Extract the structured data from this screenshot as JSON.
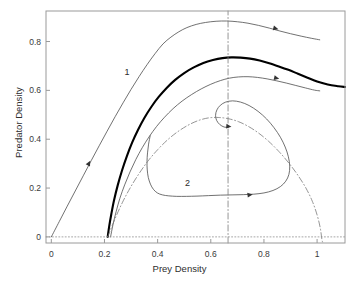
{
  "chart_data": {
    "type": "line",
    "title": "",
    "xlabel": "Prey Density",
    "ylabel": "Predator Density",
    "xlim": [
      -0.02,
      1.105
    ],
    "ylim": [
      -0.025,
      0.925
    ],
    "grid": false,
    "legend": "none",
    "xticks": [
      0,
      0.2,
      0.4,
      0.6,
      0.8,
      1
    ],
    "xtick_labels": [
      "0",
      "0.2",
      "0.4",
      "0.6",
      "0.8",
      "1"
    ],
    "yticks": [
      0,
      0.2,
      0.4,
      0.6,
      0.8
    ],
    "ytick_labels": [
      "0",
      "0.2",
      "0.4",
      "0.6",
      "0.8"
    ],
    "annotations": [
      {
        "text": "1",
        "x": 0.285,
        "y": 0.677
      },
      {
        "text": "2",
        "x": 0.512,
        "y": 0.219
      }
    ],
    "series": [
      {
        "name": "trajectory-1-outer",
        "style": "solid",
        "width": 0.8,
        "color": "#4d4d4d",
        "arrow_at": [
          [
            0.142,
            0.302
          ],
          [
            0.845,
            0.853
          ]
        ],
        "points": [
          [
            0.0,
            0.0
          ],
          [
            0.03,
            0.063
          ],
          [
            0.06,
            0.126
          ],
          [
            0.09,
            0.188
          ],
          [
            0.12,
            0.25
          ],
          [
            0.15,
            0.312
          ],
          [
            0.18,
            0.373
          ],
          [
            0.21,
            0.433
          ],
          [
            0.24,
            0.492
          ],
          [
            0.27,
            0.549
          ],
          [
            0.3,
            0.604
          ],
          [
            0.33,
            0.656
          ],
          [
            0.36,
            0.705
          ],
          [
            0.39,
            0.75
          ],
          [
            0.42,
            0.79
          ],
          [
            0.45,
            0.818
          ],
          [
            0.48,
            0.84
          ],
          [
            0.51,
            0.857
          ],
          [
            0.545,
            0.87
          ],
          [
            0.58,
            0.878
          ],
          [
            0.62,
            0.883
          ],
          [
            0.66,
            0.884
          ],
          [
            0.7,
            0.881
          ],
          [
            0.74,
            0.875
          ],
          [
            0.78,
            0.866
          ],
          [
            0.82,
            0.855
          ],
          [
            0.86,
            0.843
          ],
          [
            0.9,
            0.832
          ],
          [
            0.94,
            0.822
          ],
          [
            0.98,
            0.813
          ],
          [
            1.01,
            0.807
          ]
        ]
      },
      {
        "name": "limit-cycle-thick",
        "style": "solid",
        "width": 2.1,
        "color": "#000000",
        "arrow_at": [],
        "points": [
          [
            0.212,
            0.0
          ],
          [
            0.218,
            0.045
          ],
          [
            0.226,
            0.095
          ],
          [
            0.236,
            0.15
          ],
          [
            0.25,
            0.212
          ],
          [
            0.266,
            0.272
          ],
          [
            0.284,
            0.33
          ],
          [
            0.304,
            0.386
          ],
          [
            0.326,
            0.438
          ],
          [
            0.35,
            0.487
          ],
          [
            0.376,
            0.532
          ],
          [
            0.404,
            0.573
          ],
          [
            0.434,
            0.61
          ],
          [
            0.466,
            0.643
          ],
          [
            0.5,
            0.671
          ],
          [
            0.536,
            0.694
          ],
          [
            0.572,
            0.712
          ],
          [
            0.608,
            0.724
          ],
          [
            0.644,
            0.732
          ],
          [
            0.678,
            0.735
          ],
          [
            0.712,
            0.734
          ],
          [
            0.748,
            0.73
          ],
          [
            0.784,
            0.722
          ],
          [
            0.82,
            0.711
          ],
          [
            0.856,
            0.698
          ],
          [
            0.892,
            0.684
          ],
          [
            0.928,
            0.668
          ],
          [
            0.964,
            0.652
          ],
          [
            1.0,
            0.636
          ],
          [
            1.04,
            0.624
          ],
          [
            1.08,
            0.617
          ],
          [
            1.105,
            0.614
          ]
        ]
      },
      {
        "name": "trajectory-1-inner",
        "style": "solid",
        "width": 0.8,
        "color": "#4d4d4d",
        "arrow_at": [
          [
            0.848,
            0.65
          ]
        ],
        "points": [
          [
            0.223,
            0.0
          ],
          [
            0.232,
            0.05
          ],
          [
            0.244,
            0.104
          ],
          [
            0.258,
            0.158
          ],
          [
            0.276,
            0.213
          ],
          [
            0.296,
            0.266
          ],
          [
            0.318,
            0.317
          ],
          [
            0.342,
            0.365
          ],
          [
            0.368,
            0.41
          ],
          [
            0.396,
            0.452
          ],
          [
            0.426,
            0.49
          ],
          [
            0.458,
            0.525
          ],
          [
            0.492,
            0.556
          ],
          [
            0.528,
            0.583
          ],
          [
            0.564,
            0.606
          ],
          [
            0.6,
            0.625
          ],
          [
            0.636,
            0.64
          ],
          [
            0.67,
            0.65
          ],
          [
            0.704,
            0.655
          ],
          [
            0.74,
            0.656
          ],
          [
            0.776,
            0.653
          ],
          [
            0.812,
            0.647
          ],
          [
            0.848,
            0.639
          ],
          [
            0.884,
            0.63
          ],
          [
            0.92,
            0.62
          ],
          [
            0.956,
            0.61
          ],
          [
            0.99,
            0.601
          ],
          [
            1.01,
            0.598
          ]
        ]
      },
      {
        "name": "trajectory-2-spiral",
        "style": "solid",
        "width": 0.8,
        "color": "#4d4d4d",
        "arrow_at": [
          [
            0.748,
            0.172
          ],
          [
            0.668,
            0.452
          ]
        ],
        "points": [
          [
            0.372,
            0.414
          ],
          [
            0.366,
            0.38
          ],
          [
            0.362,
            0.344
          ],
          [
            0.36,
            0.308
          ],
          [
            0.361,
            0.274
          ],
          [
            0.365,
            0.243
          ],
          [
            0.373,
            0.216
          ],
          [
            0.384,
            0.195
          ],
          [
            0.399,
            0.18
          ],
          [
            0.418,
            0.172
          ],
          [
            0.442,
            0.168
          ],
          [
            0.472,
            0.166
          ],
          [
            0.508,
            0.166
          ],
          [
            0.548,
            0.167
          ],
          [
            0.592,
            0.169
          ],
          [
            0.636,
            0.171
          ],
          [
            0.68,
            0.172
          ],
          [
            0.722,
            0.173
          ],
          [
            0.762,
            0.175
          ],
          [
            0.8,
            0.18
          ],
          [
            0.834,
            0.19
          ],
          [
            0.862,
            0.206
          ],
          [
            0.882,
            0.228
          ],
          [
            0.894,
            0.256
          ],
          [
            0.897,
            0.29
          ],
          [
            0.892,
            0.328
          ],
          [
            0.88,
            0.368
          ],
          [
            0.862,
            0.408
          ],
          [
            0.838,
            0.447
          ],
          [
            0.81,
            0.483
          ],
          [
            0.778,
            0.514
          ],
          [
            0.744,
            0.538
          ],
          [
            0.712,
            0.552
          ],
          [
            0.682,
            0.557
          ],
          [
            0.656,
            0.552
          ],
          [
            0.636,
            0.539
          ],
          [
            0.623,
            0.52
          ],
          [
            0.618,
            0.498
          ],
          [
            0.622,
            0.477
          ],
          [
            0.634,
            0.46
          ],
          [
            0.65,
            0.45
          ],
          [
            0.666,
            0.448
          ]
        ]
      },
      {
        "name": "prey-nullcline",
        "style": "dashdot",
        "width": 0.8,
        "color": "#7a7a7a",
        "arrow_at": [],
        "points": [
          [
            0.212,
            0.0
          ],
          [
            0.24,
            0.075
          ],
          [
            0.268,
            0.142
          ],
          [
            0.298,
            0.203
          ],
          [
            0.33,
            0.259
          ],
          [
            0.364,
            0.311
          ],
          [
            0.4,
            0.357
          ],
          [
            0.438,
            0.398
          ],
          [
            0.476,
            0.431
          ],
          [
            0.514,
            0.457
          ],
          [
            0.552,
            0.476
          ],
          [
            0.59,
            0.487
          ],
          [
            0.628,
            0.489
          ],
          [
            0.666,
            0.484
          ],
          [
            0.704,
            0.472
          ],
          [
            0.742,
            0.452
          ],
          [
            0.78,
            0.425
          ],
          [
            0.818,
            0.391
          ],
          [
            0.856,
            0.35
          ],
          [
            0.894,
            0.302
          ],
          [
            0.928,
            0.252
          ],
          [
            0.958,
            0.2
          ],
          [
            0.982,
            0.146
          ],
          [
            1.0,
            0.09
          ],
          [
            1.012,
            0.036
          ],
          [
            1.018,
            -0.01
          ],
          [
            1.022,
            -0.025
          ]
        ]
      },
      {
        "name": "predator-nullcline",
        "style": "dashdot",
        "width": 0.8,
        "color": "#7a7a7a",
        "arrow_at": [],
        "points": [
          [
            0.665,
            -0.025
          ],
          [
            0.665,
            0.925
          ]
        ]
      },
      {
        "name": "zero-axis-dotted",
        "style": "dotted",
        "width": 0.8,
        "color": "#8f8f8f",
        "arrow_at": [],
        "points": [
          [
            -0.02,
            0.0
          ],
          [
            1.105,
            0.0
          ]
        ]
      }
    ],
    "equilibrium_point": {
      "x": 0.665,
      "y": 0.448
    }
  }
}
